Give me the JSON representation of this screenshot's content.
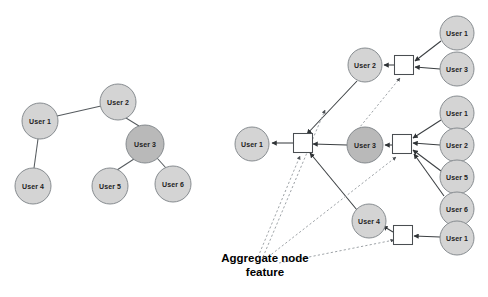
{
  "figure": {
    "caption": {
      "line1": "Aggregate node",
      "line2": "feature"
    },
    "colors": {
      "node_fill_light": "#d4d4d4",
      "node_fill_dark": "#b9b9b9",
      "node_stroke": "#7d8287",
      "edge": "#555a5e",
      "dotted_edge": "#8d9297",
      "box_fill": "#ffffff",
      "box_stroke": "#4a4e52",
      "background": "#ffffff",
      "text": "#222222"
    }
  },
  "left_graph": {
    "name": "social-graph",
    "nodes": [
      {
        "id": "L1",
        "label": "User 1",
        "cx": 40,
        "cy": 121,
        "r": 18,
        "shade": "light"
      },
      {
        "id": "L2",
        "label": "User 2",
        "cx": 118,
        "cy": 102,
        "r": 18,
        "shade": "light"
      },
      {
        "id": "L3",
        "label": "User 3",
        "cx": 145,
        "cy": 144,
        "r": 19,
        "shade": "dark"
      },
      {
        "id": "L4",
        "label": "User 4",
        "cx": 33,
        "cy": 186,
        "r": 18,
        "shade": "light"
      },
      {
        "id": "L5",
        "label": "User 5",
        "cx": 110,
        "cy": 186,
        "r": 18,
        "shade": "light"
      },
      {
        "id": "L6",
        "label": "User 6",
        "cx": 173,
        "cy": 184,
        "r": 18,
        "shade": "light"
      }
    ],
    "edges": [
      {
        "from": "L1",
        "to": "L2"
      },
      {
        "from": "L1",
        "to": "L4"
      },
      {
        "from": "L2",
        "to": "L3"
      },
      {
        "from": "L3",
        "to": "L5"
      },
      {
        "from": "L3",
        "to": "L6"
      }
    ]
  },
  "right_graph": {
    "name": "aggregation-graph",
    "nodes": [
      {
        "id": "R_out1",
        "label": "User 1",
        "cx": 252,
        "cy": 144,
        "r": 17,
        "shade": "light"
      },
      {
        "id": "R_u2",
        "label": "User 2",
        "cx": 365,
        "cy": 65,
        "r": 17,
        "shade": "light"
      },
      {
        "id": "R_u3",
        "label": "User 3",
        "cx": 365,
        "cy": 145,
        "r": 18,
        "shade": "dark"
      },
      {
        "id": "R_u4",
        "label": "User 4",
        "cx": 369,
        "cy": 221,
        "r": 17,
        "shade": "light"
      },
      {
        "id": "R_t1",
        "label": "User 1",
        "cx": 457,
        "cy": 33,
        "r": 17,
        "shade": "light"
      },
      {
        "id": "R_t3",
        "label": "User 3",
        "cx": 457,
        "cy": 69,
        "r": 17,
        "shade": "light"
      },
      {
        "id": "R_m1",
        "label": "User 1",
        "cx": 457,
        "cy": 113,
        "r": 17,
        "shade": "light"
      },
      {
        "id": "R_m2",
        "label": "User 2",
        "cx": 457,
        "cy": 145,
        "r": 17,
        "shade": "light"
      },
      {
        "id": "R_m5",
        "label": "User 5",
        "cx": 457,
        "cy": 177,
        "r": 17,
        "shade": "light"
      },
      {
        "id": "R_m6",
        "label": "User 6",
        "cx": 457,
        "cy": 209,
        "r": 17,
        "shade": "light"
      },
      {
        "id": "R_b1",
        "label": "User 1",
        "cx": 457,
        "cy": 238,
        "r": 17,
        "shade": "light"
      }
    ],
    "aggregate_boxes": [
      {
        "id": "BOX_A",
        "cx": 404,
        "cy": 65,
        "size": 19
      },
      {
        "id": "BOX_B",
        "cx": 303,
        "cy": 143,
        "size": 19
      },
      {
        "id": "BOX_C",
        "cx": 402,
        "cy": 144,
        "size": 19
      },
      {
        "id": "BOX_D",
        "cx": 403,
        "cy": 235,
        "size": 19
      }
    ],
    "edges": [
      {
        "from": "BOX_B",
        "to": "R_out1",
        "type": "arrow"
      },
      {
        "from": "BOX_A",
        "to": "R_u2",
        "type": "arrow"
      },
      {
        "from": "BOX_C",
        "to": "R_u3",
        "type": "arrow"
      },
      {
        "from": "BOX_D",
        "to": "R_u4",
        "type": "arrow"
      },
      {
        "from": "R_t1",
        "to": "BOX_A",
        "type": "arrow"
      },
      {
        "from": "R_t3",
        "to": "BOX_A",
        "type": "arrow"
      },
      {
        "from": "R_m1",
        "to": "BOX_C",
        "type": "arrow"
      },
      {
        "from": "R_m2",
        "to": "BOX_C",
        "type": "arrow"
      },
      {
        "from": "R_m5",
        "to": "BOX_C",
        "type": "arrow"
      },
      {
        "from": "R_m6",
        "to": "BOX_C",
        "type": "arrow"
      },
      {
        "from": "R_b1",
        "to": "BOX_D",
        "type": "arrow"
      },
      {
        "from": "R_u2",
        "to": "BOX_B",
        "type": "arrow"
      },
      {
        "from": "R_u3",
        "to": "BOX_B",
        "type": "arrow"
      },
      {
        "from": "R_u4",
        "to": "BOX_B",
        "type": "arrow"
      }
    ],
    "dotted_edges": [
      {
        "from": "BOX_A",
        "to": "R_u3",
        "type": "dotted-arrow"
      },
      {
        "from": "caption",
        "to": "BOX_B",
        "type": "dotted-arrow"
      },
      {
        "from": "caption",
        "to": "BOX_C",
        "type": "dotted-arrow"
      },
      {
        "from": "caption",
        "to": "BOX_A",
        "type": "dotted-arrow"
      },
      {
        "from": "caption",
        "to": "BOX_D",
        "type": "dotted-arrow"
      }
    ]
  }
}
